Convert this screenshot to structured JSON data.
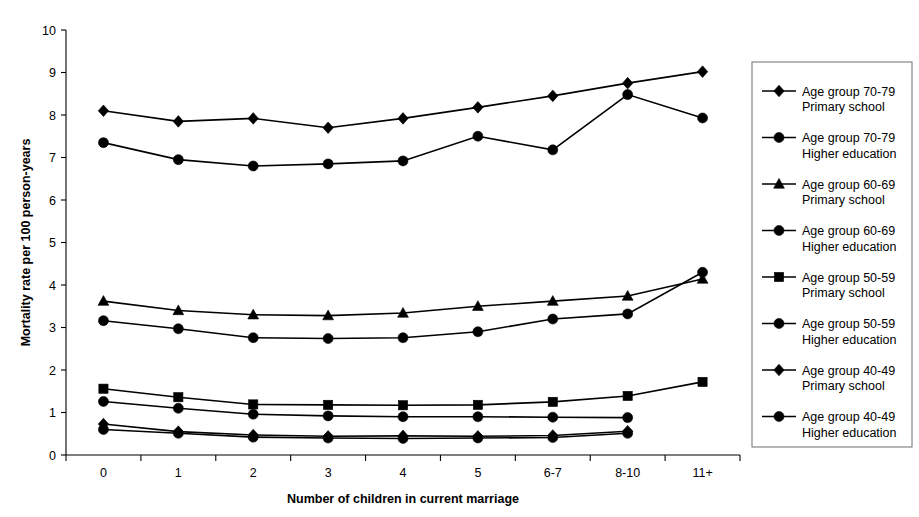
{
  "chart_data": {
    "type": "line",
    "title": "",
    "xlabel": "Number of children in current marriage",
    "ylabel": "Mortality rate per 100 person-years",
    "categories": [
      "0",
      "1",
      "2",
      "3",
      "4",
      "5",
      "6-7",
      "8-10",
      "11+"
    ],
    "ylim": [
      0,
      10
    ],
    "ytick_labels": [
      "0",
      "1",
      "2",
      "3",
      "4",
      "5",
      "6",
      "7",
      "8",
      "9",
      "10"
    ],
    "ytick_values": [
      0,
      1,
      2,
      3,
      4,
      5,
      6,
      7,
      8,
      9,
      10
    ],
    "grid": false,
    "legend_position": "right",
    "series": [
      {
        "name": "Age group 70-79 Primary school",
        "label_line1": "Age group 70-79",
        "label_line2": "Primary school",
        "marker": "diamond",
        "values": [
          8.1,
          7.85,
          7.92,
          7.7,
          7.92,
          8.18,
          8.45,
          8.75,
          9.02
        ]
      },
      {
        "name": "Age group 70-79 Higher education",
        "label_line1": "Age group 70-79",
        "label_line2": "Higher education",
        "marker": "circle",
        "values": [
          7.35,
          6.95,
          6.8,
          6.85,
          6.92,
          7.5,
          7.18,
          8.48,
          7.93
        ]
      },
      {
        "name": "Age group 60-69 Primary school",
        "label_line1": "Age group 60-69",
        "label_line2": "Primary school",
        "marker": "triangle",
        "values": [
          3.62,
          3.4,
          3.3,
          3.28,
          3.34,
          3.5,
          3.62,
          3.74,
          4.14
        ]
      },
      {
        "name": "Age group 60-69 Higher education",
        "label_line1": "Age group 60-69",
        "label_line2": "Higher education",
        "marker": "circle",
        "values": [
          3.16,
          2.97,
          2.76,
          2.74,
          2.76,
          2.9,
          3.2,
          3.32,
          4.3
        ]
      },
      {
        "name": "Age group 50-59 Primary school",
        "label_line1": "Age group 50-59",
        "label_line2": "Primary school",
        "marker": "square",
        "values": [
          1.56,
          1.36,
          1.19,
          1.18,
          1.17,
          1.18,
          1.25,
          1.39,
          1.72
        ]
      },
      {
        "name": "Age group 50-59 Higher education",
        "label_line1": "Age group 50-59",
        "label_line2": "Higher education",
        "marker": "circle",
        "values": [
          1.26,
          1.1,
          0.96,
          0.92,
          0.9,
          0.9,
          0.89,
          0.88,
          null
        ]
      },
      {
        "name": "Age group 40-49 Primary school",
        "label_line1": "Age group 40-49",
        "label_line2": "Primary school",
        "marker": "diamond",
        "values": [
          0.73,
          0.55,
          0.47,
          0.44,
          0.45,
          0.44,
          0.46,
          0.56,
          null
        ]
      },
      {
        "name": "Age group 40-49 Higher education",
        "label_line1": "Age group 40-49",
        "label_line2": "Higher education",
        "marker": "circle",
        "values": [
          0.6,
          0.51,
          0.42,
          0.4,
          0.39,
          0.4,
          0.41,
          0.51,
          null
        ]
      }
    ]
  },
  "colors": {
    "ink": "#000000",
    "axis": "#000000",
    "legend_border": "#7a7a7a",
    "background": "#ffffff"
  },
  "axes": {
    "xlabel": "Number of children in current marriage",
    "ylabel": "Mortality rate per 100 person-years"
  },
  "legend": {
    "entries": [
      {
        "line1": "Age group 70-79",
        "line2": "Primary school",
        "marker": "diamond"
      },
      {
        "line1": "Age group 70-79",
        "line2": "Higher education",
        "marker": "circle"
      },
      {
        "line1": "Age group 60-69",
        "line2": "Primary school",
        "marker": "triangle"
      },
      {
        "line1": "Age group 60-69",
        "line2": "Higher education",
        "marker": "circle"
      },
      {
        "line1": "Age group 50-59",
        "line2": "Primary school",
        "marker": "square"
      },
      {
        "line1": "Age group 50-59",
        "line2": "Higher education",
        "marker": "circle"
      },
      {
        "line1": "Age group 40-49",
        "line2": "Primary school",
        "marker": "diamond"
      },
      {
        "line1": "Age group 40-49",
        "line2": "Higher education",
        "marker": "circle"
      }
    ]
  }
}
